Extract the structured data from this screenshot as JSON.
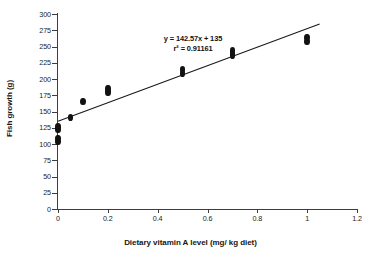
{
  "chart_data": {
    "type": "scatter",
    "title": "",
    "xlabel": "Dietary vitamin A level (mg/ kg diet)",
    "ylabel": "Fish growth (g)",
    "xlim": [
      0,
      1.2
    ],
    "ylim": [
      0,
      300
    ],
    "xticks": [
      "0",
      "0.2",
      "0.4",
      "0.6",
      "0.8",
      "1",
      "1.2"
    ],
    "xtick_values": [
      0,
      0.2,
      0.4,
      0.6,
      0.8,
      1,
      1.2
    ],
    "yticks": [
      "0",
      "25",
      "50",
      "75",
      "100",
      "125",
      "150",
      "175",
      "200",
      "225",
      "250",
      "275",
      "300"
    ],
    "ytick_values": [
      0,
      25,
      50,
      75,
      100,
      125,
      150,
      175,
      200,
      225,
      250,
      275,
      300
    ],
    "grid": false,
    "legend": false,
    "marker": "filled-diamond",
    "marker_color": "#121212",
    "line_color": "#1a1a1a",
    "annotations": [
      {
        "name": "regression-equation",
        "text": "y = 142.57x + 135"
      },
      {
        "name": "r-squared",
        "text": "r² = 0.91161"
      }
    ],
    "regression": {
      "slope": 142.57,
      "intercept": 135,
      "r_squared": 0.91161,
      "x_start": 0.0,
      "x_end": 1.05
    },
    "points": [
      {
        "x": 0.0,
        "y": 104
      },
      {
        "x": 0.0,
        "y": 108
      },
      {
        "x": 0.0,
        "y": 123
      },
      {
        "x": 0.0,
        "y": 127
      },
      {
        "x": 0.05,
        "y": 141
      },
      {
        "x": 0.1,
        "y": 166
      },
      {
        "x": 0.2,
        "y": 180
      },
      {
        "x": 0.2,
        "y": 185
      },
      {
        "x": 0.5,
        "y": 208
      },
      {
        "x": 0.5,
        "y": 214
      },
      {
        "x": 0.7,
        "y": 237
      },
      {
        "x": 0.7,
        "y": 243
      },
      {
        "x": 1.0,
        "y": 258
      },
      {
        "x": 1.0,
        "y": 264
      }
    ]
  }
}
